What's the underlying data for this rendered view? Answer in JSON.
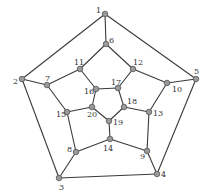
{
  "diagram": {
    "type": "graph",
    "colors": {
      "edge": "#3a3a3a",
      "node_fill": "#9a9a9a",
      "node_stroke": "#555555",
      "label": "#333333"
    },
    "nodes": [
      {
        "id": "1",
        "label": "1",
        "x": 105,
        "y": 14,
        "lx": 96,
        "ly": 13
      },
      {
        "id": "2",
        "label": "2",
        "x": 22,
        "y": 79,
        "lx": 13,
        "ly": 84
      },
      {
        "id": "3",
        "label": "3",
        "x": 59,
        "y": 178,
        "lx": 59,
        "ly": 190
      },
      {
        "id": "4",
        "label": "4",
        "x": 157,
        "y": 174,
        "lx": 161,
        "ly": 177
      },
      {
        "id": "5",
        "label": "5",
        "x": 196,
        "y": 79,
        "lx": 194,
        "ly": 74
      },
      {
        "id": "6",
        "label": "6",
        "x": 106,
        "y": 44,
        "lx": 109,
        "ly": 43
      },
      {
        "id": "7",
        "label": "7",
        "x": 47,
        "y": 85,
        "lx": 45,
        "ly": 81
      },
      {
        "id": "8",
        "label": "8",
        "x": 76,
        "y": 152,
        "lx": 67,
        "ly": 152
      },
      {
        "id": "9",
        "label": "9",
        "x": 147,
        "y": 151,
        "lx": 140,
        "ly": 159
      },
      {
        "id": "10",
        "label": "10",
        "x": 167,
        "y": 83,
        "lx": 172,
        "ly": 92
      },
      {
        "id": "11",
        "label": "11",
        "x": 80,
        "y": 69,
        "lx": 74,
        "ly": 65
      },
      {
        "id": "12",
        "label": "12",
        "x": 133,
        "y": 69,
        "lx": 133,
        "ly": 65
      },
      {
        "id": "13",
        "label": "13",
        "x": 149,
        "y": 112,
        "lx": 153,
        "ly": 116
      },
      {
        "id": "14",
        "label": "14",
        "x": 110,
        "y": 139,
        "lx": 103,
        "ly": 151
      },
      {
        "id": "15",
        "label": "15",
        "x": 67,
        "y": 112,
        "lx": 56,
        "ly": 117
      },
      {
        "id": "16",
        "label": "16",
        "x": 96,
        "y": 89,
        "lx": 84,
        "ly": 94
      },
      {
        "id": "17",
        "label": "17",
        "x": 118,
        "y": 88,
        "lx": 111,
        "ly": 85
      },
      {
        "id": "18",
        "label": "18",
        "x": 124,
        "y": 107,
        "lx": 127,
        "ly": 104
      },
      {
        "id": "19",
        "label": "19",
        "x": 109,
        "y": 121,
        "lx": 113,
        "ly": 125
      },
      {
        "id": "20",
        "label": "20",
        "x": 92,
        "y": 107,
        "lx": 87,
        "ly": 117
      }
    ],
    "edges": [
      [
        "1",
        "2"
      ],
      [
        "1",
        "5"
      ],
      [
        "1",
        "6"
      ],
      [
        "2",
        "3"
      ],
      [
        "2",
        "7"
      ],
      [
        "3",
        "4"
      ],
      [
        "3",
        "8"
      ],
      [
        "4",
        "5"
      ],
      [
        "4",
        "9"
      ],
      [
        "5",
        "10"
      ],
      [
        "6",
        "11"
      ],
      [
        "6",
        "12"
      ],
      [
        "7",
        "11"
      ],
      [
        "7",
        "15"
      ],
      [
        "8",
        "15"
      ],
      [
        "8",
        "14"
      ],
      [
        "9",
        "14"
      ],
      [
        "9",
        "13"
      ],
      [
        "10",
        "12"
      ],
      [
        "10",
        "13"
      ],
      [
        "11",
        "16"
      ],
      [
        "12",
        "17"
      ],
      [
        "13",
        "18"
      ],
      [
        "14",
        "19"
      ],
      [
        "15",
        "20"
      ],
      [
        "16",
        "17"
      ],
      [
        "17",
        "18"
      ],
      [
        "18",
        "19"
      ],
      [
        "19",
        "20"
      ],
      [
        "20",
        "16"
      ]
    ]
  }
}
